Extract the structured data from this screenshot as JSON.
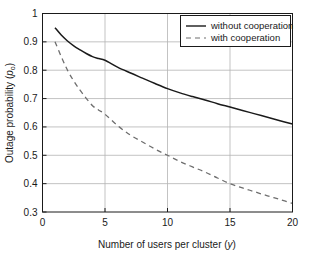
{
  "chart_data": {
    "type": "line",
    "title": "",
    "xlabel": "Number of users per cluster (y)",
    "xlabel_text": "Number of users per cluster (",
    "xlabel_var": "y",
    "xlabel_tail": ")",
    "ylabel": "Outage probability (p_o)",
    "ylabel_text": "Outage probability (",
    "ylabel_var": "p",
    "ylabel_sub": "o",
    "ylabel_tail": ")",
    "xlim": [
      0,
      20
    ],
    "ylim": [
      0.3,
      1
    ],
    "xticks": [
      0,
      5,
      10,
      15,
      20
    ],
    "xticklabels": [
      "0",
      "5",
      "10",
      "15",
      "20"
    ],
    "yticks": [
      0.3,
      0.4,
      0.5,
      0.6,
      0.7,
      0.8,
      0.9,
      1
    ],
    "yticklabels": [
      "0.3",
      "0.4",
      "0.5",
      "0.6",
      "0.7",
      "0.8",
      "0.9",
      "1"
    ],
    "grid": true,
    "grid_color": "#b4b4b4",
    "axes_color": "#1a1a1a",
    "background": "#ffffff",
    "legend_position": "top-right",
    "series": [
      {
        "name": "without cooperation",
        "style": "solid",
        "color": "#1a1a1a",
        "x": [
          1,
          1.5,
          2,
          2.5,
          3,
          3.5,
          4,
          4.5,
          5,
          6,
          7,
          8,
          9,
          10,
          11,
          12,
          13,
          14,
          15,
          16,
          17,
          18,
          19,
          20
        ],
        "values": [
          0.95,
          0.924,
          0.903,
          0.886,
          0.872,
          0.859,
          0.848,
          0.841,
          0.835,
          0.811,
          0.791,
          0.772,
          0.753,
          0.735,
          0.72,
          0.707,
          0.695,
          0.682,
          0.67,
          0.658,
          0.646,
          0.634,
          0.622,
          0.61
        ]
      },
      {
        "name": "with cooperation",
        "style": "dashed",
        "color": "#6e6e6e",
        "x": [
          1,
          1.5,
          2,
          2.5,
          3,
          3.5,
          4,
          4.5,
          5,
          6,
          7,
          8,
          9,
          10,
          11,
          12,
          13,
          14,
          15,
          16,
          17,
          18,
          19,
          20
        ],
        "values": [
          0.9,
          0.848,
          0.8,
          0.762,
          0.73,
          0.701,
          0.675,
          0.659,
          0.645,
          0.605,
          0.572,
          0.547,
          0.522,
          0.5,
          0.478,
          0.459,
          0.441,
          0.42,
          0.4,
          0.385,
          0.371,
          0.357,
          0.344,
          0.33
        ]
      }
    ]
  },
  "legend": {
    "items": [
      {
        "label": "without cooperation",
        "style": "solid"
      },
      {
        "label": "with cooperation",
        "style": "dashed"
      }
    ]
  }
}
